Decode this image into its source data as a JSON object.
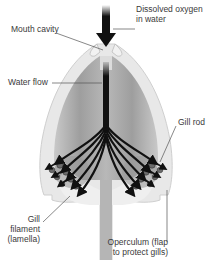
{
  "diagram": {
    "colors": {
      "arrow": "#111111",
      "outer_body": "#e6e6e6",
      "inner_cavity": "#a9a9a9",
      "operculum": "#efefef",
      "gill_tissue": "#8a8a8a",
      "label_text": "#3a3a3a",
      "leader_line": "#555555"
    },
    "labels": {
      "dissolved_oxygen_line1": "Dissolved oxygen",
      "dissolved_oxygen_line2": "in water",
      "mouth_cavity": "Mouth cavity",
      "water_flow": "Water flow",
      "gill_rod": "Gill rod",
      "gill_filament_line1": "Gill",
      "gill_filament_line2": "filament",
      "gill_filament_line3": "(lamella)",
      "operculum_line1": "Operculum (flap",
      "operculum_line2": "to protect gills)"
    }
  }
}
